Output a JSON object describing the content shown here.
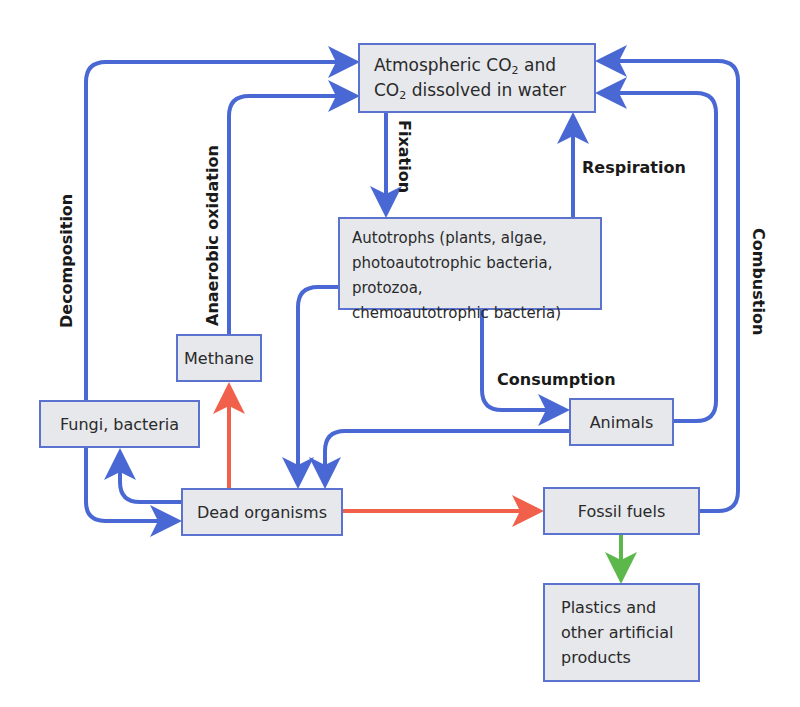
{
  "diagram": {
    "colors": {
      "blue_arrow": "#4a68d4",
      "red_arrow": "#f0604a",
      "green_arrow": "#5cb84a",
      "box_fill": "#e6e8ec",
      "box_border": "#5b72cf"
    },
    "nodes": {
      "atmospheric": {
        "line1_a": "Atmospheric CO",
        "line1_sub": "2",
        "line1_b": " and",
        "line2_a": "CO",
        "line2_sub": "2",
        "line2_b": " dissolved in water"
      },
      "autotrophs": {
        "line1": "Autotrophs (plants, algae,",
        "line2": "photoautotrophic bacteria, protozoa,",
        "line3": "chemoautotrophic bacteria)"
      },
      "methane": "Methane",
      "fungi": "Fungi, bacteria",
      "dead": "Dead organisms",
      "animals": "Animals",
      "fossil": "Fossil fuels",
      "plastics": {
        "line1": "Plastics and",
        "line2": "other artificial",
        "line3": "products"
      }
    },
    "labels": {
      "fixation": "Fixation",
      "respiration": "Respiration",
      "decomposition": "Decomposition",
      "anaerobic": "Anaerobic oxidation",
      "consumption": "Consumption",
      "combustion": "Combustion"
    },
    "edges": [
      {
        "from": "Fungi, bacteria",
        "to": "Atmospheric CO2",
        "label": "Decomposition",
        "color": "blue"
      },
      {
        "from": "Methane",
        "to": "Atmospheric CO2",
        "label": "Anaerobic oxidation",
        "color": "blue"
      },
      {
        "from": "Atmospheric CO2",
        "to": "Autotrophs",
        "label": "Fixation",
        "color": "blue"
      },
      {
        "from": "Autotrophs",
        "to": "Atmospheric CO2",
        "label": "Respiration",
        "color": "blue"
      },
      {
        "from": "Animals",
        "to": "Atmospheric CO2",
        "label": "Respiration",
        "color": "blue"
      },
      {
        "from": "Fossil fuels",
        "to": "Atmospheric CO2",
        "label": "Combustion",
        "color": "blue"
      },
      {
        "from": "Autotrophs",
        "to": "Animals",
        "label": "Consumption",
        "color": "blue"
      },
      {
        "from": "Autotrophs",
        "to": "Dead organisms",
        "color": "blue"
      },
      {
        "from": "Animals",
        "to": "Dead organisms",
        "color": "blue"
      },
      {
        "from": "Dead organisms",
        "to": "Fungi, bacteria",
        "color": "blue"
      },
      {
        "from": "Fungi, bacteria",
        "to": "Dead organisms",
        "color": "blue"
      },
      {
        "from": "Dead organisms",
        "to": "Methane",
        "color": "red"
      },
      {
        "from": "Dead organisms",
        "to": "Fossil fuels",
        "color": "red"
      },
      {
        "from": "Fossil fuels",
        "to": "Plastics and other artificial products",
        "color": "green"
      }
    ]
  }
}
